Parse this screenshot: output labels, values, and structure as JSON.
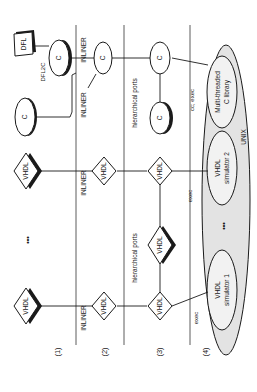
{
  "diagram": {
    "orientation": "rotated-90-ccw",
    "rows": [
      {
        "label": "(1)"
      },
      {
        "label": "(2)"
      },
      {
        "label": "(3)"
      },
      {
        "label": "(4)"
      }
    ],
    "row1": {
      "vhdl_a": "VHDL",
      "ellipsis": "•••",
      "vhdl_b": "VHDL",
      "c_node": "C",
      "c_node2": "C",
      "dfl": "DFL",
      "dfl2c": "DFL2C"
    },
    "row2": {
      "inliner_a": "INLINER",
      "vhdl_a": "VHDL",
      "inliner_b": "INLINER",
      "vhdl_b": "VHDL",
      "inliner_c": "INLINER",
      "inliner_d": "INLINER",
      "c_node": "C"
    },
    "row3": {
      "vhdl_a": "VHDL",
      "hier_ports_a": "hierarchical ports",
      "vhdl_mid": "VHDL",
      "vhdl_b": "VHDL",
      "hier_ports_b": "hierarchical ports",
      "c_node": "C",
      "c_node2": "C"
    },
    "row4": {
      "exec_a": "exec",
      "exec_b": "exec",
      "cc_exec": "cc; exec",
      "sim1_line1": "VHDL",
      "sim1_line2": "simulator 1",
      "ellipsis": "•••",
      "sim2_line1": "VHDL",
      "sim2_line2": "simulator 2",
      "lib_line1": "Multi-threaded",
      "lib_line2": "C library",
      "unix": "UNIX"
    }
  }
}
